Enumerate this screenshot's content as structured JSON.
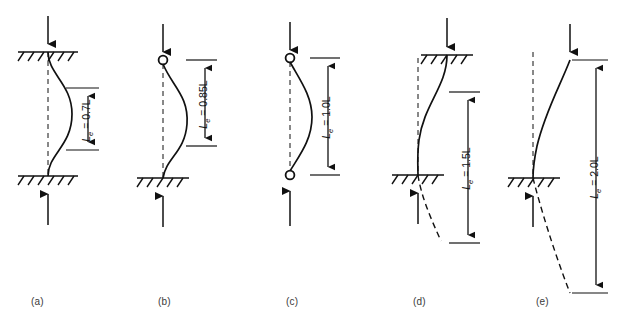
{
  "figure": {
    "type": "engineering-diagram",
    "symbol_base": "L",
    "symbol_subscript": "e",
    "equals": " = "
  },
  "cases": [
    {
      "key": "a",
      "label": "(a)",
      "label_x": 38,
      "label_y": 303,
      "effective_length_text": "0.7L",
      "dim_label_full": "Le = 0.7L",
      "top_support": "fixed",
      "bottom_support": "fixed",
      "top_load": "down-arrow",
      "bottom_load": "up-arrow",
      "sway": false,
      "axis_x": 48,
      "top_y": 52,
      "bottom_y": 176,
      "dim_x": 88,
      "dim_top_y": 88,
      "dim_bottom_y": 150,
      "dim_label_x": 78,
      "dim_label_y": 119
    },
    {
      "key": "b",
      "label": "(b)",
      "label_x": 165,
      "label_y": 303,
      "effective_length_text": "0.85L",
      "dim_label_full": "Le = 0.85L",
      "top_support": "pinned",
      "bottom_support": "fixed",
      "top_load": "down-arrow",
      "bottom_load": "up-arrow",
      "sway": false,
      "axis_x": 163,
      "top_y": 60,
      "bottom_y": 178,
      "dim_x": 205,
      "dim_top_y": 60,
      "dim_bottom_y": 146,
      "dim_label_x": 195,
      "dim_label_y": 103
    },
    {
      "key": "c",
      "label": "(c)",
      "label_x": 293,
      "label_y": 303,
      "effective_length_text": "1.0L",
      "dim_label_full": "Le = 1.0L",
      "top_support": "pinned",
      "bottom_support": "pinned",
      "top_load": "down-arrow",
      "bottom_load": "up-arrow",
      "sway": false,
      "axis_x": 290,
      "top_y": 58,
      "bottom_y": 175,
      "dim_x": 328,
      "dim_top_y": 58,
      "dim_bottom_y": 175,
      "dim_label_x": 318,
      "dim_label_y": 116
    },
    {
      "key": "d",
      "label": "(d)",
      "label_x": 420,
      "label_y": 303,
      "effective_length_text": "1.5L",
      "dim_label_full": "Le = 1.5L",
      "top_support": "fixed-sliding",
      "bottom_support": "fixed",
      "top_load": "down-arrow",
      "bottom_load": "up-arrow",
      "sway": true,
      "axis_x": 418,
      "top_y": 55,
      "bottom_y": 175,
      "dim_x": 468,
      "dim_top_y": 92,
      "dim_bottom_y": 243,
      "dim_label_x": 458,
      "dim_label_y": 167
    },
    {
      "key": "e",
      "label": "(e)",
      "label_x": 543,
      "label_y": 303,
      "effective_length_text": "2.0L",
      "dim_label_full": "Le = 2.0L",
      "top_support": "free",
      "bottom_support": "fixed",
      "top_load": "down-arrow",
      "bottom_load": "up-arrow",
      "sway": true,
      "axis_x": 533,
      "top_y": 60,
      "bottom_y": 178,
      "dim_x": 596,
      "dim_top_y": 60,
      "dim_bottom_y": 293,
      "dim_label_x": 586,
      "dim_label_y": 176
    }
  ],
  "colors": {
    "line": "#111111",
    "dashed": "#111111",
    "label": "#3a3a3a",
    "background": "#ffffff"
  }
}
